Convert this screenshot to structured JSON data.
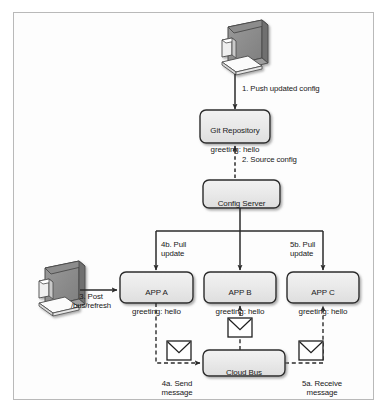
{
  "figure": {
    "frame_color": "#b9b9b9",
    "background": "#ffffff",
    "node_fill": "#e9e9e9",
    "node_stroke": "#2b2b2b",
    "line_color": "#2b2b2b",
    "text_color": "#1b1b1b"
  },
  "nodes": {
    "git_repository": {
      "line1": "Git Repository",
      "line2": "greeting: hello"
    },
    "config_server": {
      "line1": "Config Server"
    },
    "app_a": {
      "line1": "APP A",
      "line2": "greeting: hello"
    },
    "app_b": {
      "line1": "APP B",
      "line2": "greeting: hello"
    },
    "app_c": {
      "line1": "APP C",
      "line2": "greeting: hello"
    },
    "cloud_bus": {
      "line1": "Cloud Bus"
    }
  },
  "icons": {
    "top_workstation": "desktop-computer-icon",
    "left_workstation": "desktop-computer-icon",
    "envelope_center": "envelope-icon",
    "envelope_left": "envelope-icon",
    "envelope_right": "envelope-icon"
  },
  "edges": [
    {
      "id": "step1",
      "label": "1. Push updated config",
      "style": "solid"
    },
    {
      "id": "step2",
      "label": "2. Source config",
      "style": "dashed"
    },
    {
      "id": "step3",
      "label": "3. Post\n/bus/refresh",
      "style": "solid"
    },
    {
      "id": "step4b",
      "label": "4b. Pull\nupdate",
      "style": "solid"
    },
    {
      "id": "step5b",
      "label": "5b. Pull\nupdate",
      "style": "solid"
    },
    {
      "id": "step4a",
      "label": "4a. Send\nmessage",
      "style": "dashed"
    },
    {
      "id": "step5a",
      "label": "5a. Receive\nmessage",
      "style": "dashed"
    },
    {
      "id": "bus_to_appb",
      "label": "",
      "style": "dashed"
    }
  ]
}
